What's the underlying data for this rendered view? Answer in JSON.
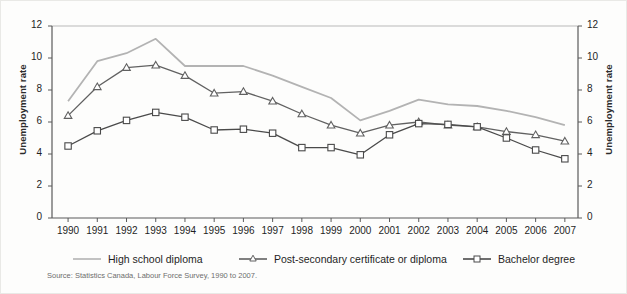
{
  "chart_data": {
    "type": "line",
    "title": "",
    "subtitle": "",
    "xlabel": "",
    "ylabel": "Unemployment rate",
    "ylabel_right": "Unemployment rate",
    "ylim": [
      0,
      12
    ],
    "yticks": [
      0,
      2,
      4,
      6,
      8,
      10,
      12
    ],
    "grid": false,
    "legend_position": "bottom",
    "categories": [
      "1990",
      "1991",
      "1992",
      "1993",
      "1994",
      "1995",
      "1996",
      "1997",
      "1998",
      "1999",
      "2000",
      "2001",
      "2002",
      "2003",
      "2004",
      "2005",
      "2006",
      "2007"
    ],
    "x": [
      1990,
      1991,
      1992,
      1993,
      1994,
      1995,
      1996,
      1997,
      1998,
      1999,
      2000,
      2001,
      2002,
      2003,
      2004,
      2005,
      2006,
      2007
    ],
    "series": [
      {
        "name": "High school diploma",
        "color": "#b3b3b3",
        "marker": "none",
        "values": [
          7.3,
          9.8,
          10.3,
          11.2,
          9.5,
          9.5,
          9.5,
          8.9,
          8.2,
          7.5,
          6.1,
          6.7,
          7.4,
          7.1,
          7.0,
          6.7,
          6.3,
          5.8
        ]
      },
      {
        "name": "Post-secondary certificate or diploma",
        "color": "#616161",
        "marker": "triangle",
        "values": [
          6.4,
          8.2,
          9.4,
          9.55,
          8.9,
          7.8,
          7.9,
          7.3,
          6.5,
          5.8,
          5.3,
          5.8,
          6.0,
          5.8,
          5.7,
          5.4,
          5.2,
          4.8
        ]
      },
      {
        "name": "Bachelor degree",
        "color": "#4a4a4a",
        "marker": "square",
        "values": [
          4.5,
          5.45,
          6.1,
          6.6,
          6.3,
          5.5,
          5.55,
          5.3,
          4.4,
          4.4,
          3.95,
          5.2,
          5.9,
          5.85,
          5.7,
          5.0,
          4.25,
          3.7
        ]
      }
    ],
    "source": "Source: Statistics Canada, Labour Force Survey, 1990 to 2007."
  },
  "axes": {
    "y_left_title": "Unemployment rate",
    "y_right_title": "Unemployment rate"
  }
}
